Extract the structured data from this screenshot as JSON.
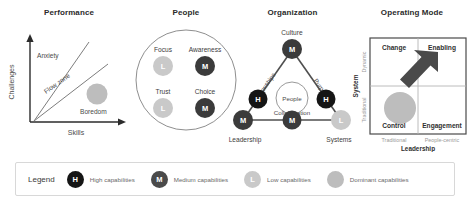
{
  "colors": {
    "high": "#1c1c1c",
    "medium": "#4a4a4a",
    "low": "#c9c9c9",
    "dominant": "#bdbdbd",
    "line": "#5a5a5a",
    "panel_border": "#d8d8d8",
    "text": "#3a3a3a"
  },
  "panels": {
    "performance": {
      "title": "Performance",
      "y_axis": "Challenges",
      "x_axis": "Skills",
      "zones": [
        {
          "label": "Anxiety"
        },
        {
          "label": "Flow zone"
        },
        {
          "label": "Boredom"
        }
      ],
      "dominant_marker": "dominant-capabilities"
    },
    "people": {
      "title": "People",
      "items": [
        {
          "label": "Focus",
          "level": "L"
        },
        {
          "label": "Awareness",
          "level": "M"
        },
        {
          "label": "Trust",
          "level": "L"
        },
        {
          "label": "Choice",
          "level": "M"
        }
      ]
    },
    "organization": {
      "title": "Organization",
      "vertices": [
        {
          "label": "Culture",
          "level": "M"
        },
        {
          "label": "Leadership",
          "level": "M"
        },
        {
          "label": "Systems",
          "level": "L"
        }
      ],
      "edges": [
        {
          "label": "Relationships",
          "level": "H"
        },
        {
          "label": "Purpose",
          "level": "H"
        },
        {
          "label": "Collaboration",
          "level": "M"
        }
      ],
      "center": "People"
    },
    "operating_mode": {
      "title": "Operating Mode",
      "y_axis_title": "System",
      "y_ticks": [
        "Dynamic",
        "Traditional"
      ],
      "x_axis_title": "Leadership",
      "x_ticks": [
        "Traditional",
        "People-centric"
      ],
      "quadrants": [
        {
          "label": "Change"
        },
        {
          "label": "Enabling"
        },
        {
          "label": "Control"
        },
        {
          "label": "Engagement"
        }
      ],
      "current_state_marker": "dominant-capabilities",
      "direction_marker": "growth-arrow"
    }
  },
  "legend": {
    "title": "Legend",
    "items": [
      {
        "badge": "H",
        "label": "High capabilities",
        "color": "#1c1c1c"
      },
      {
        "badge": "M",
        "label": "Medium capabilities",
        "color": "#4a4a4a"
      },
      {
        "badge": "L",
        "label": "Low capabilities",
        "color": "#c9c9c9"
      },
      {
        "badge": "",
        "label": "Dominant capabilities",
        "color": "#bdbdbd"
      }
    ]
  }
}
